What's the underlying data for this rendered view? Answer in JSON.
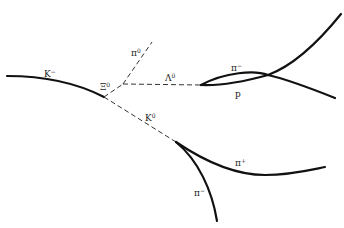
{
  "diagram": {
    "type": "bubble-chamber-event",
    "labels": {
      "k_minus": {
        "base": "K",
        "sup": "−"
      },
      "xi_zero": {
        "base": "Ξ",
        "sup": "0"
      },
      "pi_zero": {
        "base": "π",
        "sup": "0"
      },
      "lambda_zero": {
        "base": "Λ",
        "sup": "0"
      },
      "k_zero": {
        "base": "K",
        "sup": "0"
      },
      "pi_minus_lambda": {
        "base": "π",
        "sup": "−"
      },
      "proton": {
        "base": "p",
        "sup": ""
      },
      "pi_plus": {
        "base": "π",
        "sup": "+"
      },
      "pi_minus_k": {
        "base": "π",
        "sup": "−"
      }
    },
    "tracks": [
      {
        "particle": "K-",
        "style": "solid"
      },
      {
        "particle": "Xi0",
        "style": "dashed"
      },
      {
        "particle": "pi0",
        "style": "dashed"
      },
      {
        "particle": "Lambda0",
        "style": "dashed"
      },
      {
        "particle": "K0",
        "style": "dashed"
      },
      {
        "particle": "pi-",
        "style": "solid"
      },
      {
        "particle": "p",
        "style": "solid"
      },
      {
        "particle": "pi+",
        "style": "solid"
      },
      {
        "particle": "pi-",
        "style": "solid"
      }
    ],
    "colors": {
      "track": "#111111",
      "background": "#ffffff"
    }
  }
}
